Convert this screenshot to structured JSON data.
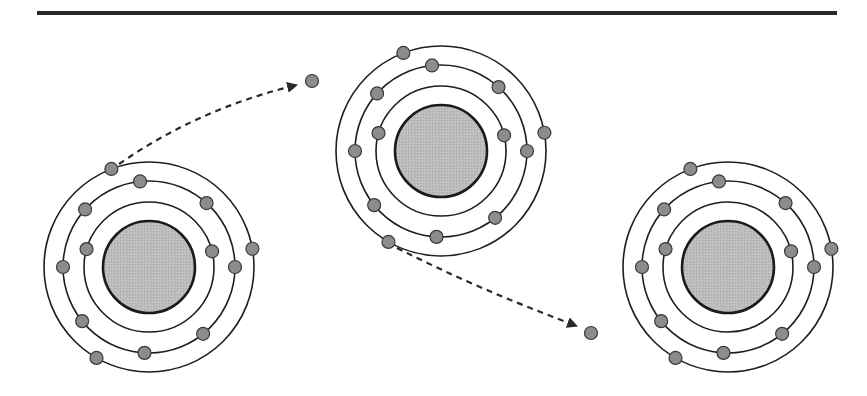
{
  "canvas": {
    "width": 867,
    "height": 396,
    "background": "#ffffff"
  },
  "top_rule": {
    "x1": 37,
    "x2": 837,
    "y": 13,
    "stroke": "#2a2a2a",
    "width": 4
  },
  "colors": {
    "shell_stroke": "#1e1e1e",
    "nucleus_fill": "#b9b9b9",
    "nucleus_stroke": "#1a1a1a",
    "electron_fill": "#8c8c8c",
    "electron_stroke": "#3a3a3a",
    "arrow_stroke": "#2a2a2a"
  },
  "electron_radius": 6.5,
  "atoms": [
    {
      "id": "atom-left",
      "cx": 149,
      "cy": 267,
      "nucleus_r": 46,
      "shells": [
        {
          "r": 65,
          "electron_angles": [
            196,
            -14
          ]
        },
        {
          "r": 86,
          "electron_angles": [
            -96,
            -48,
            -138,
            0,
            180,
            141,
            93,
            51
          ]
        },
        {
          "r": 105,
          "electron_angles": [
            -111,
            -10,
            120
          ]
        }
      ]
    },
    {
      "id": "atom-middle",
      "cx": 441,
      "cy": 151,
      "nucleus_r": 46,
      "shells": [
        {
          "r": 65,
          "electron_angles": [
            196,
            -14
          ]
        },
        {
          "r": 86,
          "electron_angles": [
            -96,
            -48,
            -138,
            0,
            180,
            141,
            93,
            51
          ]
        },
        {
          "r": 105,
          "electron_angles": [
            -111,
            -10,
            120
          ]
        }
      ]
    },
    {
      "id": "atom-right",
      "cx": 728,
      "cy": 267,
      "nucleus_r": 46,
      "shells": [
        {
          "r": 65,
          "electron_angles": [
            196,
            -14
          ]
        },
        {
          "r": 86,
          "electron_angles": [
            -96,
            -48,
            -138,
            0,
            180,
            141,
            93,
            51
          ]
        },
        {
          "r": 105,
          "electron_angles": [
            -111,
            -10,
            120
          ]
        }
      ]
    }
  ],
  "free_electrons": [
    {
      "id": "free-electron-top",
      "x": 312,
      "y": 81
    },
    {
      "id": "free-electron-bottom",
      "x": 591,
      "y": 333
    }
  ],
  "arrows": [
    {
      "id": "arrow-top",
      "x1": 119,
      "y1": 164,
      "cx": 200,
      "cy": 108,
      "x2": 297,
      "y2": 85
    },
    {
      "id": "arrow-bottom",
      "x1": 397,
      "y1": 248,
      "cx": 480,
      "cy": 290,
      "x2": 577,
      "y2": 326
    }
  ]
}
